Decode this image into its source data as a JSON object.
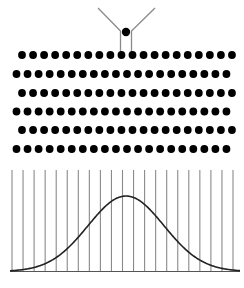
{
  "diagram": {
    "funnel": {
      "label": "funnel",
      "color": "#8a8a8a"
    },
    "ball": {
      "label": "ball",
      "color": "#000000"
    },
    "pegs": {
      "rows": 6,
      "pegs_per_row": [
        20,
        20,
        20,
        20,
        20,
        20
      ],
      "color": "#000000",
      "staggered": true
    },
    "bins": {
      "count": 20,
      "dividers": 21,
      "color": "#8a8a8a"
    },
    "curve": {
      "type": "normal-distribution",
      "color": "#222222",
      "peak_bin_position": 0.5
    }
  }
}
